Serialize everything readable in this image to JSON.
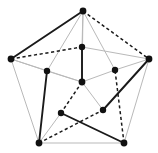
{
  "figure": {
    "background_color": "#ffffff",
    "width": 158,
    "height": 153
  },
  "chart_data": {
    "type": "diagram",
    "subtype": "node-link-graph",
    "xlabel": "",
    "ylabel": "",
    "grid": false,
    "legend": "none",
    "xlim": [
      0,
      158
    ],
    "ylim": [
      0,
      153
    ],
    "node_count": 11,
    "edge_count": 25,
    "edge_styles": {
      "solid": {
        "color": "#1a1a1a",
        "width": 1.9,
        "dash": "none",
        "label": "solid black edge"
      },
      "dashed": {
        "color": "#1a1a1a",
        "width": 1.5,
        "dash": "3.2 2.6",
        "label": "dashed black edge"
      },
      "light": {
        "color": "#b9b9b9",
        "width": 1.0,
        "dash": "none",
        "label": "light gray edge"
      }
    },
    "nodes": [
      {
        "id": "outer-top",
        "label": "outer top",
        "x": 83,
        "y": 11,
        "r": 3.4
      },
      {
        "id": "outer-left",
        "label": "outer left",
        "x": 11,
        "y": 59,
        "r": 3.4
      },
      {
        "id": "outer-right",
        "label": "outer right",
        "x": 149,
        "y": 59,
        "r": 3.4
      },
      {
        "id": "outer-bottom-left",
        "label": "outer bottom left",
        "x": 39,
        "y": 143,
        "r": 3.4
      },
      {
        "id": "outer-bottom-right",
        "label": "outer bottom right",
        "x": 124,
        "y": 143,
        "r": 3.4
      },
      {
        "id": "inner-top",
        "label": "inner top",
        "x": 82,
        "y": 47,
        "r": 3.2
      },
      {
        "id": "inner-left",
        "label": "inner left",
        "x": 47,
        "y": 71,
        "r": 3.2
      },
      {
        "id": "inner-right",
        "label": "inner right",
        "x": 115,
        "y": 70,
        "r": 3.2
      },
      {
        "id": "inner-bottom-left",
        "label": "inner bottom left",
        "x": 61,
        "y": 113,
        "r": 3.2
      },
      {
        "id": "inner-bottom-right",
        "label": "inner bottom right",
        "x": 103,
        "y": 110,
        "r": 3.2
      },
      {
        "id": "center",
        "label": "center",
        "x": 82,
        "y": 82,
        "r": 3.4
      }
    ],
    "edges": [
      {
        "source": "outer-top",
        "target": "outer-left",
        "style": "solid"
      },
      {
        "source": "outer-top",
        "target": "outer-right",
        "style": "dashed"
      },
      {
        "source": "outer-left",
        "target": "inner-top",
        "style": "dashed"
      },
      {
        "source": "inner-top",
        "target": "outer-right",
        "style": "light"
      },
      {
        "source": "outer-top",
        "target": "inner-top",
        "style": "light"
      },
      {
        "source": "outer-top",
        "target": "inner-left",
        "style": "light"
      },
      {
        "source": "outer-top",
        "target": "inner-right",
        "style": "light"
      },
      {
        "source": "outer-top",
        "target": "center",
        "style": "light"
      },
      {
        "source": "outer-left",
        "target": "outer-bottom-left",
        "style": "light"
      },
      {
        "source": "outer-left",
        "target": "inner-left",
        "style": "light"
      },
      {
        "source": "outer-left",
        "target": "center",
        "style": "light"
      },
      {
        "source": "outer-right",
        "target": "outer-bottom-right",
        "style": "light"
      },
      {
        "source": "outer-right",
        "target": "inner-right",
        "style": "light"
      },
      {
        "source": "outer-right",
        "target": "inner-bottom-right",
        "style": "solid"
      },
      {
        "source": "outer-bottom-left",
        "target": "outer-bottom-right",
        "style": "light"
      },
      {
        "source": "outer-bottom-left",
        "target": "inner-left",
        "style": "solid"
      },
      {
        "source": "outer-bottom-left",
        "target": "inner-bottom-left",
        "style": "light"
      },
      {
        "source": "outer-bottom-left",
        "target": "inner-bottom-right",
        "style": "dashed"
      },
      {
        "source": "outer-bottom-right",
        "target": "inner-bottom-left",
        "style": "solid"
      },
      {
        "source": "outer-bottom-right",
        "target": "inner-right",
        "style": "dashed"
      },
      {
        "source": "inner-top",
        "target": "center",
        "style": "solid"
      },
      {
        "source": "inner-left",
        "target": "center",
        "style": "light"
      },
      {
        "source": "inner-right",
        "target": "center",
        "style": "light"
      },
      {
        "source": "center",
        "target": "inner-bottom-left",
        "style": "dashed"
      },
      {
        "source": "center",
        "target": "inner-bottom-right",
        "style": "light"
      }
    ]
  }
}
